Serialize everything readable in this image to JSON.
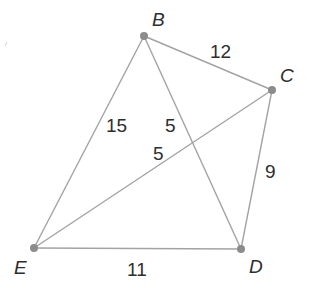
{
  "diagram": {
    "type": "graph",
    "colors": {
      "edge": "#a3a3a3",
      "vertex": "#8c8c8c",
      "text": "#2e2e2e",
      "background": "#ffffff"
    },
    "vertices": [
      {
        "id": "B",
        "label": "B",
        "x": 144,
        "y": 36,
        "label_x": 152,
        "label_y": 26
      },
      {
        "id": "C",
        "label": "C",
        "x": 272,
        "y": 90,
        "label_x": 280,
        "label_y": 82
      },
      {
        "id": "D",
        "label": "D",
        "x": 241,
        "y": 249,
        "label_x": 249,
        "label_y": 273
      },
      {
        "id": "E",
        "label": "E",
        "x": 34,
        "y": 248,
        "label_x": 14,
        "label_y": 274
      }
    ],
    "edges": [
      {
        "from": "B",
        "to": "C",
        "weight": "12",
        "label_x": 210,
        "label_y": 58
      },
      {
        "from": "B",
        "to": "E",
        "weight": "15",
        "label_x": 106,
        "label_y": 132
      },
      {
        "from": "B",
        "to": "D",
        "weight": "5",
        "label_x": 165,
        "label_y": 132
      },
      {
        "from": "C",
        "to": "E",
        "weight": "5",
        "label_x": 153,
        "label_y": 160
      },
      {
        "from": "C",
        "to": "D",
        "weight": "9",
        "label_x": 265,
        "label_y": 178
      },
      {
        "from": "E",
        "to": "D",
        "weight": "11",
        "label_x": 127,
        "label_y": 276
      }
    ]
  }
}
